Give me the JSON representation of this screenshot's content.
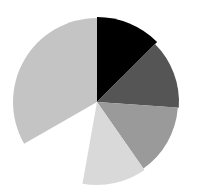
{
  "chart_data": {
    "type": "pie",
    "title": "",
    "center": [
      97,
      102
    ],
    "start_angle_deg": 0,
    "direction": "clockwise",
    "legend": [],
    "slices": [
      {
        "label": "",
        "value": 12.5,
        "color": "#000000",
        "radius": 85
      },
      {
        "label": "",
        "value": 13.6,
        "color": "#555555",
        "radius": 82
      },
      {
        "label": "",
        "value": 14.2,
        "color": "#9a9a9a",
        "radius": 81
      },
      {
        "label": "",
        "value": 12.5,
        "color": "#d9d9d9",
        "radius": 83
      },
      {
        "label": "",
        "value": 13.9,
        "color": "none",
        "radius": 0,
        "note": "missing wedge / gap"
      },
      {
        "label": "",
        "value": 33.3,
        "color": "#c4c4c4",
        "radius": 84
      }
    ]
  }
}
